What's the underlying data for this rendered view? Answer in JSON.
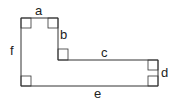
{
  "diagram": {
    "type": "rectilinear-L-shape",
    "labels": {
      "a": "a",
      "b": "b",
      "c": "c",
      "d": "d",
      "e": "e",
      "f": "f"
    },
    "line_color": "#333333"
  }
}
